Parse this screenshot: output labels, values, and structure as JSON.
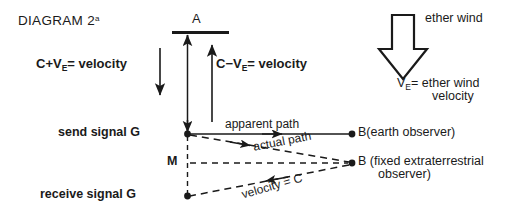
{
  "diagram": {
    "title_main": "DIAGRAM 2",
    "title_sup": "a",
    "mirror_label": "A",
    "ether_wind_label": "ether wind",
    "ether_velocity_v": "V",
    "ether_velocity_sub": "E",
    "ether_velocity_rest": "= ether wind",
    "ether_velocity_line2": "velocity",
    "down_beam": {
      "prefix": "C+V",
      "sub": "E",
      "suffix": "= velocity"
    },
    "up_beam": {
      "prefix": "C−V",
      "sub": "E",
      "suffix": "= velocity"
    },
    "points": {
      "send_signal": "send signal G",
      "midpoint": "M",
      "receive_signal": "receive signal G",
      "b_earth": "B(earth observer)",
      "b_fixed_line1": "B (fixed extraterrestrial",
      "b_fixed_line2": "observer)"
    },
    "paths": {
      "apparent": "apparent path",
      "actual": "actual path",
      "velocity_c": "velocity = C"
    },
    "colors": {
      "ink": "#1a1a1a",
      "background": "#ffffff"
    }
  }
}
